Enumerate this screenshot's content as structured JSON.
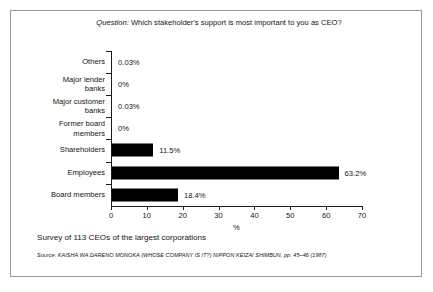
{
  "figure": {
    "title_italic_prefix": "Question:",
    "title_rest": " Which stakeholder's support is most important to you as CEO?",
    "survey_note": "Survey of 113 CEOs of the largest corporations",
    "source_label": "Source:",
    "source_text": " KAISHA WA DARENO MONOKA (WHOSE COMPANY IS IT?) NIPPON KEIZAI SHIMBUN, pp. 45–46 (1987)",
    "border_color": "#9a9a9a",
    "bar_color": "#000000",
    "text_color": "#141414"
  },
  "chart_data": {
    "type": "bar",
    "orientation": "horizontal",
    "title": "Question: Which stakeholder's support is most important to you as CEO?",
    "xlabel": "%",
    "ylabel": "",
    "xlim": [
      0,
      70
    ],
    "xticks": [
      0,
      10,
      20,
      30,
      40,
      50,
      60,
      70
    ],
    "xtick_labels": [
      "0",
      "10",
      "20",
      "30",
      "40",
      "50",
      "60",
      "70"
    ],
    "grid": false,
    "legend": false,
    "categories": [
      "Others",
      "Major lender banks",
      "Major customer banks",
      "Former board members",
      "Shareholders",
      "Employees",
      "Board members"
    ],
    "category_lines": [
      [
        "Others"
      ],
      [
        "Major lender",
        "banks"
      ],
      [
        "Major customer",
        "banks"
      ],
      [
        "Former board",
        "members"
      ],
      [
        "Shareholders"
      ],
      [
        "Employees"
      ],
      [
        "Board members"
      ]
    ],
    "values": [
      0.03,
      0,
      0.03,
      0,
      11.5,
      63.2,
      18.4
    ],
    "value_labels": [
      "0.03%",
      "0%",
      "0.03%",
      "0%",
      "11.5%",
      "63.2%",
      "18.4%"
    ]
  }
}
